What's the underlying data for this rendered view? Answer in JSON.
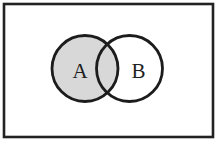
{
  "diagram": {
    "type": "venn",
    "universe": {
      "x": 4,
      "y": 4,
      "width": 209,
      "height": 133,
      "stroke": "#222222",
      "stroke_width": 2.6,
      "fill": "#ffffff"
    },
    "sets": [
      {
        "label": "A",
        "cx": 85,
        "cy": 68.5,
        "r": 33,
        "fill": "#d8d8d8",
        "stroke": "#1c1c1c",
        "stroke_width": 2.8,
        "shaded": true,
        "label_x": 80,
        "label_y": 78
      },
      {
        "label": "B",
        "cx": 129.5,
        "cy": 68.5,
        "r": 33,
        "fill": "none",
        "stroke": "#1c1c1c",
        "stroke_width": 2.8,
        "shaded": false,
        "label_x": 138.5,
        "label_y": 78
      }
    ],
    "shaded_region": "A",
    "colors": {
      "shade": "#d8d8d8",
      "line": "#1c1c1c",
      "background": "#ffffff"
    }
  }
}
